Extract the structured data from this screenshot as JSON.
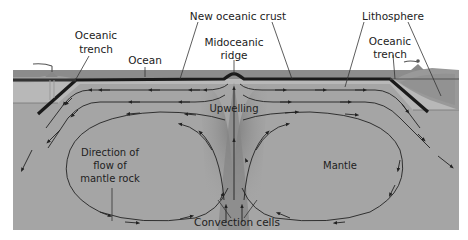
{
  "diagram": {
    "labels": {
      "new_oceanic_crust": "New oceanic crust",
      "lithosphere": "Lithosphere",
      "oceanic_trench_left_line1": "Oceanic",
      "oceanic_trench_left_line2": "trench",
      "ocean": "Ocean",
      "midoceanic_ridge_line1": "Midoceanic",
      "midoceanic_ridge_line2": "ridge",
      "oceanic_trench_right_line1": "Oceanic",
      "oceanic_trench_right_line2": "trench",
      "upwelling": "Upwelling",
      "direction_line1": "Direction of",
      "direction_line2": "flow of",
      "direction_line3": "mantle rock",
      "mantle": "Mantle",
      "convection_cells": "Convection cells"
    },
    "colors": {
      "ocean": "#8a8a8a",
      "crust": "#1a1a1a",
      "lithosphere": "#b4b4b4",
      "mantle": "#a3a3a3",
      "upwelling": "#7a7a7a",
      "continent": "#9a9a9a",
      "arrow": "#222222"
    }
  }
}
